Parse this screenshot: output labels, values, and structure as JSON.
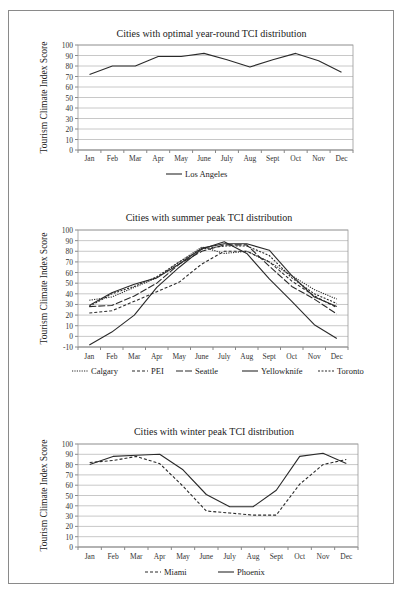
{
  "figure": {
    "border_color": "#8a8a8a",
    "grid_color": "#c8c8c8",
    "line_color": "#2a2a2a"
  },
  "chart_data": [
    {
      "type": "line",
      "title": "Cities with optimal year-round TCI distribution",
      "xlabel": "",
      "ylabel": "Tourism Climate Index Score",
      "categories": [
        "Jan",
        "Feb",
        "Mar",
        "Apr",
        "May",
        "June",
        "July",
        "Aug",
        "Sept",
        "Oct",
        "Nov",
        "Dec"
      ],
      "ylim": [
        0,
        100
      ],
      "yticks": [
        0,
        10,
        20,
        30,
        40,
        50,
        60,
        70,
        80,
        90,
        100
      ],
      "grid": true,
      "legend_position": "bottom",
      "series": [
        {
          "name": "Los Angeles",
          "style": "solid",
          "values": [
            72,
            80,
            80,
            89,
            89,
            92,
            86,
            79,
            86,
            92,
            85,
            74
          ]
        }
      ]
    },
    {
      "type": "line",
      "title": "Cities with summer peak TCI distribution",
      "xlabel": "",
      "ylabel": "Tourism Climate Index Score",
      "categories": [
        "Jan",
        "Feb",
        "Mar",
        "Apr",
        "May",
        "June",
        "July",
        "Aug",
        "Sept",
        "Oct",
        "Nov",
        "Dec"
      ],
      "ylim": [
        -10,
        100
      ],
      "yticks": [
        -10,
        0,
        10,
        20,
        30,
        40,
        50,
        60,
        70,
        80,
        90,
        100
      ],
      "grid": true,
      "legend_position": "bottom",
      "series": [
        {
          "name": "Calgary",
          "style": "dotted",
          "values": [
            34,
            37,
            46,
            55,
            70,
            84,
            78,
            80,
            70,
            57,
            44,
            35
          ]
        },
        {
          "name": "PEI",
          "style": "dashed",
          "values": [
            22,
            24,
            33,
            42,
            51,
            68,
            80,
            80,
            70,
            52,
            38,
            27
          ]
        },
        {
          "name": "Seattle",
          "style": "longdash",
          "values": [
            28,
            29,
            38,
            50,
            68,
            80,
            86,
            86,
            66,
            47,
            35,
            21
          ]
        },
        {
          "name": "Yellowknife",
          "style": "solid",
          "values": [
            -8,
            4,
            20,
            46,
            65,
            82,
            89,
            78,
            54,
            33,
            11,
            -2
          ]
        },
        {
          "name": "Toronto",
          "style": "shortdash",
          "values": [
            28,
            40,
            47,
            56,
            70,
            82,
            85,
            85,
            76,
            55,
            40,
            31
          ]
        },
        {
          "name": "Seattle-outline",
          "style": "hidden",
          "values": []
        }
      ],
      "seattle_secondary_note": "",
      "extra_solid": {
        "name": "",
        "values": [
          29,
          41,
          49,
          55,
          68,
          83,
          87,
          87,
          81,
          57,
          37,
          28
        ]
      }
    },
    {
      "type": "line",
      "title": "Cities with winter peak TCI distribution",
      "xlabel": "",
      "ylabel": "Tourism Climate Index Score",
      "categories": [
        "Jan",
        "Feb",
        "Mar",
        "Apr",
        "May",
        "June",
        "July",
        "Aug",
        "Sept",
        "Oct",
        "Nov",
        "Dec"
      ],
      "ylim": [
        0,
        100
      ],
      "yticks": [
        0,
        10,
        20,
        30,
        40,
        50,
        60,
        70,
        80,
        90,
        100
      ],
      "grid": true,
      "legend_position": "bottom",
      "series": [
        {
          "name": "Miami",
          "style": "dashed",
          "values": [
            82,
            84,
            88,
            81,
            59,
            35,
            33,
            31,
            31,
            61,
            80,
            85
          ]
        },
        {
          "name": "Phoenix",
          "style": "solid",
          "values": [
            80,
            88,
            89,
            90,
            75,
            51,
            39,
            39,
            55,
            88,
            91,
            81
          ]
        }
      ]
    }
  ]
}
